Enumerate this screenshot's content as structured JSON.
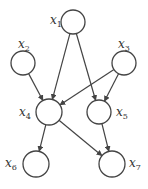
{
  "diagram": {
    "type": "directed-graph",
    "colors": {
      "stroke": "#444444",
      "background": "#ffffff"
    },
    "nodes": [
      {
        "id": "x1",
        "label": "x",
        "sub": "1",
        "cx": 73,
        "cy": 22,
        "r": 12,
        "lx": 50,
        "ly": 14
      },
      {
        "id": "x2",
        "label": "x",
        "sub": "2",
        "cx": 23,
        "cy": 63,
        "r": 12,
        "lx": 18,
        "ly": 38
      },
      {
        "id": "x3",
        "label": "x",
        "sub": "3",
        "cx": 124,
        "cy": 63,
        "r": 12,
        "lx": 118,
        "ly": 38
      },
      {
        "id": "x4",
        "label": "x",
        "sub": "4",
        "cx": 49,
        "cy": 112,
        "r": 13,
        "lx": 19,
        "ly": 106
      },
      {
        "id": "x5",
        "label": "x",
        "sub": "5",
        "cx": 99,
        "cy": 112,
        "r": 12,
        "lx": 116,
        "ly": 106
      },
      {
        "id": "x6",
        "label": "x",
        "sub": "6",
        "cx": 36,
        "cy": 164,
        "r": 13,
        "lx": 5,
        "ly": 157
      },
      {
        "id": "x7",
        "label": "x",
        "sub": "7",
        "cx": 112,
        "cy": 164,
        "r": 13,
        "lx": 129,
        "ly": 157
      }
    ],
    "edges": [
      {
        "from": "x1",
        "to": "x4"
      },
      {
        "from": "x1",
        "to": "x5"
      },
      {
        "from": "x2",
        "to": "x4"
      },
      {
        "from": "x3",
        "to": "x4"
      },
      {
        "from": "x3",
        "to": "x5"
      },
      {
        "from": "x4",
        "to": "x6"
      },
      {
        "from": "x4",
        "to": "x7"
      },
      {
        "from": "x5",
        "to": "x7"
      }
    ]
  }
}
